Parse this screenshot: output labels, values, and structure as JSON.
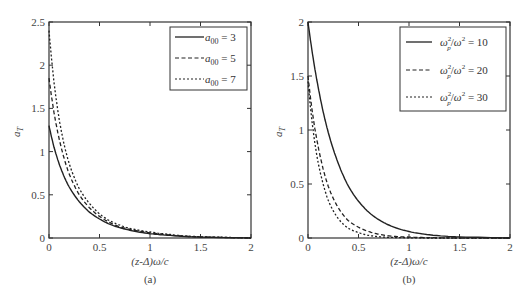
{
  "chart_data": [
    {
      "type": "line",
      "panel_label": "(a)",
      "title": "",
      "xlabel": "(z-Δ)ω/c",
      "ylabel": "a_T",
      "xlim": [
        0,
        2
      ],
      "ylim": [
        0,
        2.5
      ],
      "xticks": [
        "0",
        "0.5",
        "1",
        "1.5",
        "2"
      ],
      "yticks": [
        "0",
        "0.5",
        "1",
        "1.5",
        "2",
        "2.5"
      ],
      "grid": false,
      "legend_position": "upper right",
      "x": [
        0,
        0.05,
        0.1,
        0.15,
        0.2,
        0.3,
        0.4,
        0.5,
        0.6,
        0.7,
        0.8,
        1.0,
        1.2,
        1.5,
        2.0
      ],
      "series": [
        {
          "name": "a00 = 3",
          "legend_var": "a",
          "legend_sub": "00",
          "legend_rhs": " = 3",
          "style": "solid",
          "values": [
            1.3,
            1.05,
            0.86,
            0.71,
            0.59,
            0.42,
            0.3,
            0.22,
            0.16,
            0.12,
            0.09,
            0.05,
            0.03,
            0.01,
            0.0
          ]
        },
        {
          "name": "a00 = 5",
          "legend_var": "a",
          "legend_sub": "00",
          "legend_rhs": " = 5",
          "style": "dashed",
          "values": [
            1.85,
            1.45,
            1.15,
            0.92,
            0.74,
            0.5,
            0.35,
            0.25,
            0.18,
            0.13,
            0.1,
            0.06,
            0.035,
            0.012,
            0.0
          ]
        },
        {
          "name": "a00 = 7",
          "legend_var": "a",
          "legend_sub": "00",
          "legend_rhs": " = 7",
          "style": "dotted",
          "values": [
            2.4,
            1.8,
            1.38,
            1.08,
            0.86,
            0.57,
            0.4,
            0.28,
            0.2,
            0.15,
            0.11,
            0.07,
            0.04,
            0.014,
            0.0
          ]
        }
      ]
    },
    {
      "type": "line",
      "panel_label": "(b)",
      "title": "",
      "xlabel": "(z-Δ)ω/c",
      "ylabel": "a_T",
      "xlim": [
        0,
        2
      ],
      "ylim": [
        0,
        2
      ],
      "xticks": [
        "0",
        "0.5",
        "1",
        "1.5",
        "2"
      ],
      "yticks": [
        "0",
        "0.5",
        "1",
        "1.5",
        "2"
      ],
      "grid": false,
      "legend_position": "upper right",
      "x": [
        0,
        0.05,
        0.1,
        0.15,
        0.2,
        0.3,
        0.4,
        0.5,
        0.6,
        0.7,
        0.8,
        1.0,
        1.2,
        1.5,
        2.0
      ],
      "series": [
        {
          "name": "ωp²/ω² = 10",
          "legend_rhs": " = 10",
          "style": "solid",
          "values": [
            2.0,
            1.67,
            1.4,
            1.17,
            0.98,
            0.69,
            0.48,
            0.34,
            0.24,
            0.17,
            0.12,
            0.06,
            0.03,
            0.01,
            0.0
          ]
        },
        {
          "name": "ωp²/ω² = 20",
          "legend_rhs": " = 20",
          "style": "dashed",
          "values": [
            1.5,
            1.12,
            0.85,
            0.64,
            0.48,
            0.28,
            0.16,
            0.1,
            0.06,
            0.035,
            0.02,
            0.008,
            0.003,
            0.0,
            0.0
          ]
        },
        {
          "name": "ωp²/ω² = 30",
          "legend_rhs": " = 30",
          "style": "dotted",
          "values": [
            1.45,
            1.0,
            0.7,
            0.5,
            0.35,
            0.18,
            0.09,
            0.05,
            0.025,
            0.012,
            0.006,
            0.002,
            0.0,
            0.0,
            0.0
          ]
        }
      ]
    }
  ],
  "figure": {
    "panel_a_label": "(a)",
    "panel_b_label": "(b)",
    "xlabel_a": "(z-Δ)ω/c",
    "xlabel_b": "(z-Δ)ω/c",
    "ylabel_var": "a",
    "ylabel_sub": "T",
    "legend_omega": "ω",
    "legend_p": "p",
    "legend_sq": "2"
  }
}
